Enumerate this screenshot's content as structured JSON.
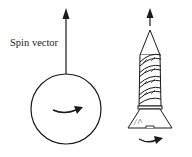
{
  "diagram": {
    "labels": {
      "spin_vector": "Spin vector"
    },
    "elements": [
      {
        "id": "left-spin-vector-arrow",
        "kind": "arrow",
        "direction": "up"
      },
      {
        "id": "spinning-ball",
        "kind": "circle"
      },
      {
        "id": "ball-rotation-arrow",
        "kind": "curved-arrow",
        "direction": "right"
      },
      {
        "id": "right-spin-vector-arrow",
        "kind": "arrow",
        "direction": "up"
      },
      {
        "id": "screw",
        "kind": "screw"
      },
      {
        "id": "screw-rotation-arrow",
        "kind": "curved-arrow",
        "direction": "right"
      }
    ],
    "colors": {
      "stroke": "#1a1a1a",
      "background": "#ffffff"
    }
  }
}
